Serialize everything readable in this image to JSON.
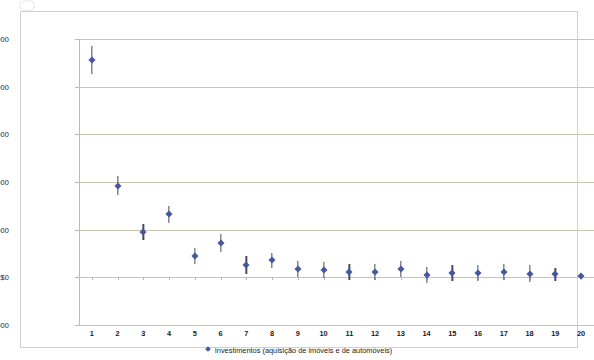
{
  "chart_data": {
    "type": "scatter",
    "title": "",
    "subtitle": "",
    "xlabel": "",
    "ylabel": "",
    "grid": true,
    "legend_position": "bottom",
    "legend_entries": [
      "Investimentos (aquisição de imóveis e de automóveis)"
    ],
    "series": [
      {
        "name": "Investimentos (aquisição de imóveis e de automóveis)",
        "marker": "diamond",
        "color": "#4457a0",
        "has_error_bars": true,
        "x": [
          1,
          2,
          3,
          4,
          5,
          6,
          7,
          8,
          9,
          10,
          11,
          12,
          13,
          14,
          15,
          16,
          17,
          18,
          19,
          20
        ],
        "values": [
          45600,
          19200,
          9500,
          13200,
          4500,
          7200,
          2600,
          3600,
          1800,
          1600,
          1100,
          1200,
          1700,
          500,
          900,
          900,
          1100,
          800,
          600,
          200
        ],
        "error": [
          3000,
          2000,
          1700,
          1700,
          1700,
          1900,
          1800,
          1600,
          1700,
          1700,
          1700,
          1700,
          1700,
          1700,
          1700,
          1700,
          1700,
          1700,
          1300,
          300
        ]
      }
    ],
    "x_categories": [
      "1",
      "2",
      "3",
      "4",
      "5",
      "6",
      "7",
      "8",
      "9",
      "10",
      "11",
      "12",
      "13",
      "14",
      "15",
      "16",
      "17",
      "18",
      "19",
      "20"
    ],
    "xlim": [
      0.5,
      20.5
    ],
    "ylim": [
      -10000,
      50000
    ],
    "ytick_values": [
      50000,
      40000,
      30000,
      20000,
      10000,
      0,
      -10000
    ],
    "ytick_labels": [
      "R$50.000",
      "R$40.000",
      "R$30.000",
      "R$20.000",
      "R$10.000",
      "R$0",
      "-R$10.000"
    ],
    "currency_prefix": "R$",
    "gridline_color": "#c9c5ae",
    "axis_color": "#b9b9b9",
    "frame_color": "#cfcfcf",
    "error_bar_color": "#4a4a5e"
  },
  "axes": {
    "y_labels": [
      "R$50.000",
      "R$40.000",
      "R$30.000",
      "R$20.000",
      "R$10.000",
      "R$0",
      "-R$10.000"
    ],
    "x_labels": [
      "1",
      "2",
      "3",
      "4",
      "5",
      "6",
      "7",
      "8",
      "9",
      "10",
      "11",
      "12",
      "13",
      "14",
      "15",
      "16",
      "17",
      "18",
      "19",
      "20"
    ]
  },
  "legend": {
    "marker_name": "diamond-marker-icon",
    "label": "Investimentos (aquisição de imóveis e de automóveis)"
  }
}
